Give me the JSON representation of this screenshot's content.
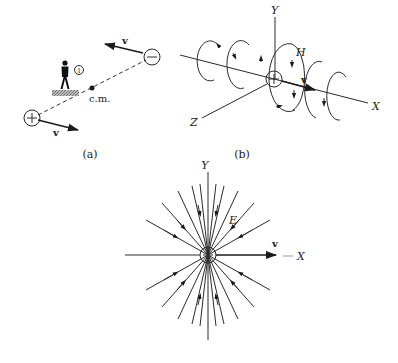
{
  "figure": {
    "panel_a": {
      "caption": "(a)",
      "velocity_top": "v",
      "velocity_bottom": "v",
      "negative_charge": "−",
      "positive_charge": "+",
      "observer_label": "①",
      "center_of_mass": "c.m."
    },
    "panel_b": {
      "caption": "(b)",
      "axis_y": "Y",
      "axis_x": "X",
      "axis_z": "Z",
      "field_label": "H",
      "velocity": "v",
      "charge": "+"
    },
    "panel_c": {
      "axis_y": "Y",
      "axis_x": "X",
      "field_label": "E",
      "velocity": "v",
      "charge": "+"
    },
    "colors": {
      "ink": "#222222",
      "background": "#ffffff"
    }
  }
}
